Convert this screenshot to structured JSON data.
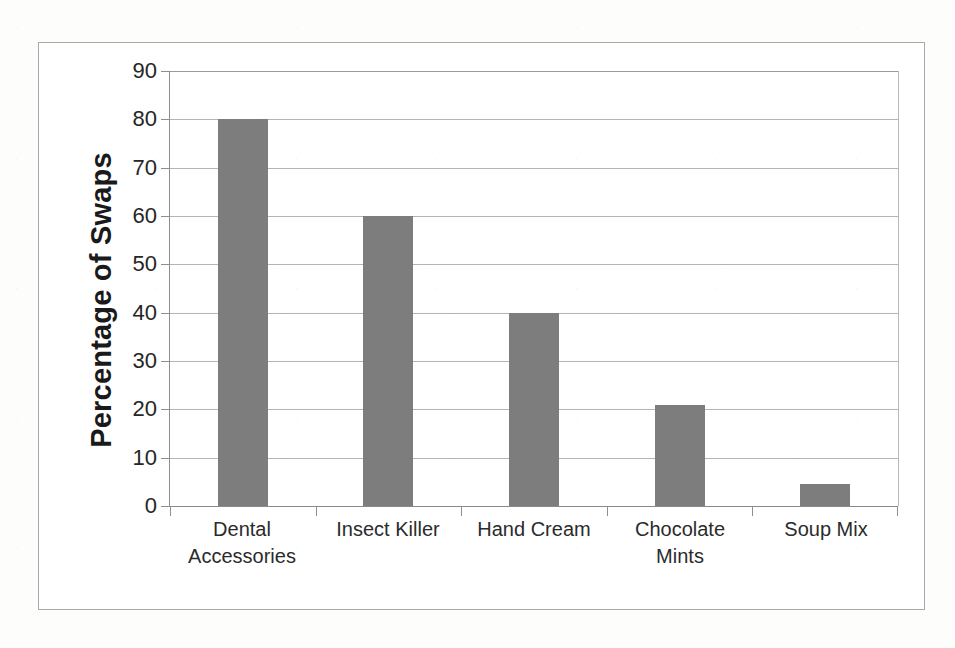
{
  "chart_data": {
    "type": "bar",
    "title": "",
    "subtitle": "",
    "xlabel": "",
    "ylabel": "Percentage of Swaps",
    "categories": [
      "Dental Accessories",
      "Insect Killer",
      "Hand Cream",
      "Chocolate Mints",
      "Soup Mix"
    ],
    "category_lines": [
      [
        "Dental",
        "Accessories"
      ],
      [
        "Insect Killer",
        ""
      ],
      [
        "Hand Cream",
        ""
      ],
      [
        "Chocolate",
        "Mints"
      ],
      [
        "Soup Mix",
        ""
      ]
    ],
    "values": [
      80,
      60,
      40,
      21,
      4.5
    ],
    "ylim": [
      0,
      90
    ],
    "ytick_step": 10,
    "yticks": [
      0,
      10,
      20,
      30,
      40,
      50,
      60,
      70,
      80,
      90
    ],
    "ytick_labels": [
      "0",
      "10",
      "20",
      "30",
      "40",
      "50",
      "60",
      "70",
      "80",
      "90"
    ],
    "grid": true,
    "legend": false,
    "legend_position": "none",
    "bar_color": "#7d7d7d",
    "gridline_color": "#b4b4b4",
    "axis_color": "#8e8e8e",
    "frame_color": "#a9a9a9",
    "background_color": "#ffffff"
  }
}
